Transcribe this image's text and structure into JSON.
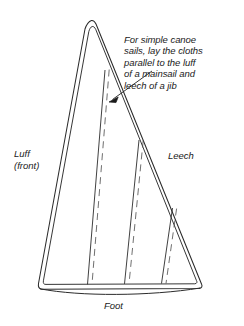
{
  "figure": {
    "kind": "sail-plan-diagram",
    "background_color": "#ffffff",
    "line_color": "#2b2b2b",
    "annotation": {
      "name": "cloth-layout-note",
      "text": "For simple canoe\nsails, lay the cloths\nparallel to the luff\nof a mainsail and\nleech of a jib",
      "leader": {
        "from_x": 152,
        "from_y": 72,
        "to_x": 110,
        "to_y": 101,
        "arrowhead": "filled-triangle"
      }
    },
    "labels": {
      "luff": "Luff\n(front)",
      "leech": "Leech",
      "foot": "Foot"
    },
    "edges": [
      {
        "name": "luff-edge",
        "label": "Luff (front)",
        "hem": "double-line"
      },
      {
        "name": "leech-edge",
        "label": "Leech",
        "hem": "double-line"
      },
      {
        "name": "foot-edge",
        "label": "Foot",
        "hem": "double-line",
        "shape": "curved"
      }
    ],
    "seams": [
      {
        "name": "seam-1",
        "stitch": "dashed"
      },
      {
        "name": "seam-2",
        "stitch": "dashed"
      },
      {
        "name": "seam-3",
        "stitch": "dashed"
      }
    ]
  }
}
